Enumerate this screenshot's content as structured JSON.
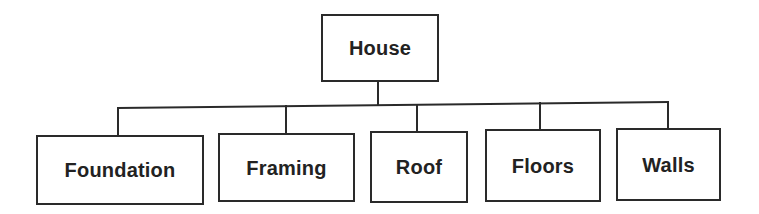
{
  "diagram": {
    "type": "hierarchy-tree",
    "line_color": "#2a2a2a",
    "text_color": "#222222",
    "root": {
      "id": "house",
      "label": "House",
      "box": {
        "x": 321,
        "y": 14,
        "w": 118,
        "h": 68
      }
    },
    "bus": {
      "x1": 118,
      "y1": 108,
      "x2": 668,
      "y2": 102,
      "stem_x": 378
    },
    "children": [
      {
        "id": "foundation",
        "label": "Foundation",
        "box": {
          "x": 36,
          "y": 135,
          "w": 168,
          "h": 70
        },
        "drop_x": 118
      },
      {
        "id": "framing",
        "label": "Framing",
        "box": {
          "x": 218,
          "y": 133,
          "w": 137,
          "h": 69
        },
        "drop_x": 286
      },
      {
        "id": "roof",
        "label": "Roof",
        "box": {
          "x": 370,
          "y": 131,
          "w": 98,
          "h": 72
        },
        "drop_x": 417
      },
      {
        "id": "floors",
        "label": "Floors",
        "box": {
          "x": 485,
          "y": 129,
          "w": 116,
          "h": 73
        },
        "drop_x": 540
      },
      {
        "id": "walls",
        "label": "Walls",
        "box": {
          "x": 616,
          "y": 128,
          "w": 105,
          "h": 73
        },
        "drop_x": 668
      }
    ]
  }
}
